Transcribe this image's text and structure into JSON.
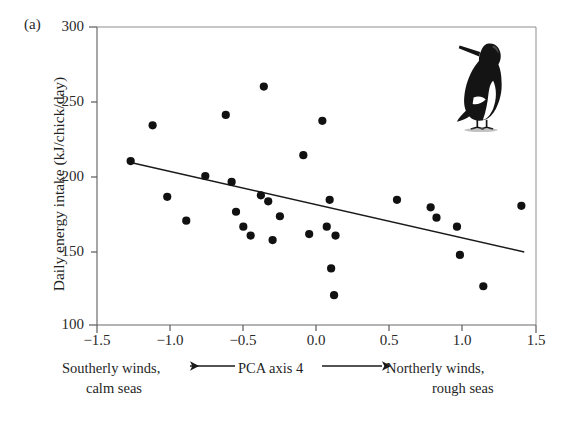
{
  "figure": {
    "panel_label": "(a)",
    "bird_icon": "guillemot-bird-illustration"
  },
  "chart_data": {
    "type": "scatter",
    "title": "",
    "xlabel": "PCA axis 4",
    "ylabel": "Daily energy intake (kJ/chick/day)",
    "xlim": [
      -1.5,
      1.5
    ],
    "ylim": [
      100,
      300
    ],
    "grid": false,
    "legend": "none",
    "xticks": [
      -1.5,
      -1.0,
      -0.5,
      0.0,
      0.5,
      1.0,
      1.5
    ],
    "xtick_labels": [
      "−1.5",
      "−1.0",
      "−0.5",
      "0.0",
      "0.5",
      "1.0",
      "1.5"
    ],
    "yticks": [
      100,
      150,
      200,
      250,
      300
    ],
    "ytick_labels": [
      "100",
      "150",
      "200",
      "250",
      "300"
    ],
    "points": [
      {
        "x": -1.27,
        "y": 210
      },
      {
        "x": -1.12,
        "y": 234
      },
      {
        "x": -1.02,
        "y": 186
      },
      {
        "x": -0.89,
        "y": 170
      },
      {
        "x": -0.76,
        "y": 200
      },
      {
        "x": -0.62,
        "y": 241
      },
      {
        "x": -0.58,
        "y": 196
      },
      {
        "x": -0.55,
        "y": 176
      },
      {
        "x": -0.5,
        "y": 166
      },
      {
        "x": -0.45,
        "y": 160
      },
      {
        "x": -0.38,
        "y": 187
      },
      {
        "x": -0.36,
        "y": 260
      },
      {
        "x": -0.33,
        "y": 183
      },
      {
        "x": -0.3,
        "y": 157
      },
      {
        "x": -0.25,
        "y": 173
      },
      {
        "x": -0.09,
        "y": 214
      },
      {
        "x": -0.05,
        "y": 161
      },
      {
        "x": 0.04,
        "y": 237
      },
      {
        "x": 0.07,
        "y": 166
      },
      {
        "x": 0.09,
        "y": 184
      },
      {
        "x": 0.1,
        "y": 138
      },
      {
        "x": 0.12,
        "y": 120
      },
      {
        "x": 0.13,
        "y": 160
      },
      {
        "x": 0.55,
        "y": 184
      },
      {
        "x": 0.78,
        "y": 179
      },
      {
        "x": 0.82,
        "y": 172
      },
      {
        "x": 0.96,
        "y": 166
      },
      {
        "x": 0.98,
        "y": 147
      },
      {
        "x": 1.14,
        "y": 126
      },
      {
        "x": 1.4,
        "y": 180
      }
    ],
    "regression_line": {
      "x_start": -1.27,
      "y_start": 209,
      "x_end": 1.42,
      "y_end": 149
    },
    "annotations": {
      "left_line1": "Southerly winds,",
      "left_line2": "calm seas",
      "center": "PCA axis 4",
      "right_line1": "Northerly winds,",
      "right_line2": "rough seas",
      "left_arrow": "left-arrow-icon",
      "right_arrow": "right-arrow-icon"
    },
    "marker_color": "#111111",
    "line_color": "#1a1a1a",
    "axis_color": "#555555"
  }
}
